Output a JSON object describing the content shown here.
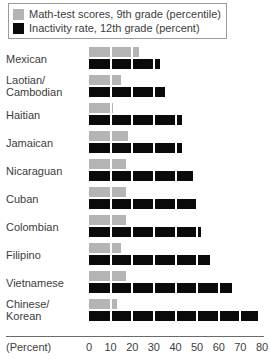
{
  "legend": {
    "items": [
      {
        "label": "Math-test scores, 9th grade (percentile)",
        "color": "#b4b4b4",
        "swatch_name": "legend-swatch-math-test-scores"
      },
      {
        "label": "Inactivity rate, 12th grade (percent)",
        "color": "#0a0a0a",
        "swatch_name": "legend-swatch-inactivity-rate"
      }
    ]
  },
  "axis": {
    "unit_label": "(Percent)",
    "ticks": [
      0,
      10,
      20,
      30,
      40,
      50,
      60,
      70,
      80
    ]
  },
  "chart_data": {
    "type": "bar",
    "orientation": "horizontal",
    "title": "",
    "subtitle": "",
    "xlabel": "(Percent)",
    "ylabel": "",
    "xlim": [
      0,
      80
    ],
    "xticks": [
      0,
      10,
      20,
      30,
      40,
      50,
      60,
      70,
      80
    ],
    "grid": false,
    "legend_position": "top-left",
    "categories": [
      "Mexican",
      "Laotian/ Cambodian",
      "Haitian",
      "Jamaican",
      "Nicaraguan",
      "Cuban",
      "Colombian",
      "Filipino",
      "Vietnamese",
      "Chinese/ Korean"
    ],
    "series": [
      {
        "name": "Math-test scores, 9th grade (percentile)",
        "color": "#b4b4b4",
        "values": [
          23,
          15,
          11,
          18,
          17,
          17,
          17,
          15,
          17,
          13
        ]
      },
      {
        "name": "Inactivity rate, 12th grade (percent)",
        "color": "#0a0a0a",
        "values": [
          33,
          35,
          43,
          43,
          48,
          50,
          52,
          56,
          66,
          78
        ]
      }
    ]
  },
  "rows": [
    {
      "label_line1": "Mexican",
      "label_line2": ""
    },
    {
      "label_line1": "Laotian/",
      "label_line2": "Cambodian"
    },
    {
      "label_line1": "Haitian",
      "label_line2": ""
    },
    {
      "label_line1": "Jamaican",
      "label_line2": ""
    },
    {
      "label_line1": "Nicaraguan",
      "label_line2": ""
    },
    {
      "label_line1": "Cuban",
      "label_line2": ""
    },
    {
      "label_line1": "Colombian",
      "label_line2": ""
    },
    {
      "label_line1": "Filipino",
      "label_line2": ""
    },
    {
      "label_line1": "Vietnamese",
      "label_line2": ""
    },
    {
      "label_line1": "Chinese/",
      "label_line2": "Korean"
    }
  ]
}
